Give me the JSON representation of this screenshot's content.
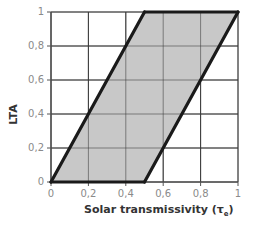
{
  "chart_data": {
    "type": "area",
    "title": "",
    "xlabel": "Solar transmissivity (τe)",
    "xlabel_main": "Solar transmissivity (τ",
    "xlabel_sub": "e",
    "xlabel_close": ")",
    "ylabel": "LTA",
    "xlim": [
      0,
      1
    ],
    "ylim": [
      0,
      1
    ],
    "grid": true,
    "x_ticks": [
      "0",
      "0,2",
      "0,4",
      "0,6",
      "0,8",
      "1"
    ],
    "y_ticks": [
      "0",
      "0,2",
      "0,4",
      "0,6",
      "0,8",
      "1"
    ],
    "polygon": {
      "name": "feasible region",
      "fill": "#c8c8c8",
      "vertices": [
        [
          0,
          0
        ],
        [
          0.5,
          1
        ],
        [
          1,
          1
        ],
        [
          0.5,
          0
        ]
      ]
    },
    "series": [
      {
        "name": "upper bound (LTA = 2·τe)",
        "x": [
          0,
          0.5
        ],
        "y": [
          0,
          1
        ]
      },
      {
        "name": "lower bound (LTA = 2·(τe − 0.5))",
        "x": [
          0.5,
          1
        ],
        "y": [
          0,
          1
        ]
      },
      {
        "name": "top edge",
        "x": [
          0.5,
          1
        ],
        "y": [
          1,
          1
        ]
      },
      {
        "name": "bottom edge",
        "x": [
          0,
          0.5
        ],
        "y": [
          0,
          0
        ]
      }
    ],
    "colors": {
      "line": "#1a1a1a",
      "grid": "#3a3a3a",
      "fill": "#c8c8c8",
      "tick_text": "#8a8a8a"
    }
  }
}
